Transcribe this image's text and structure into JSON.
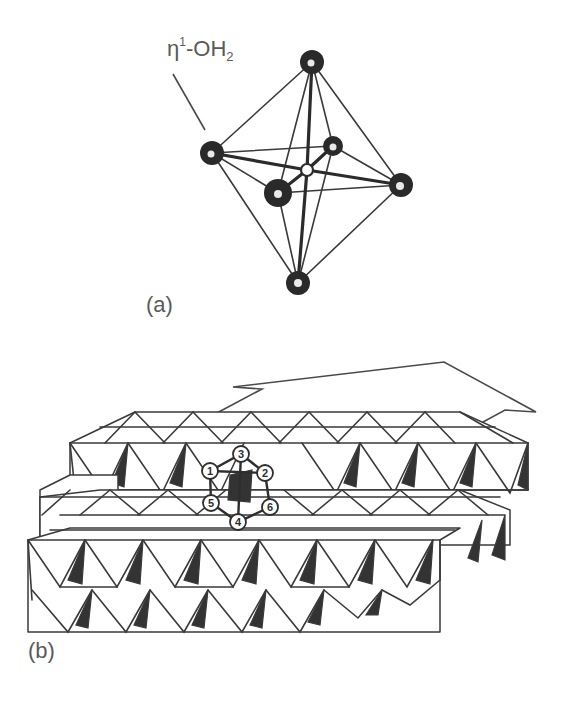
{
  "figure": {
    "panel_a": {
      "label": "(a)",
      "ligand_label": {
        "eta": "η",
        "superscript": "1",
        "mid": "-OH",
        "subscript": "2"
      },
      "description": "Octahedral cluster with central atom and six vertex atoms",
      "atoms": {
        "top": [
          312,
          62
        ],
        "bottom": [
          298,
          283
        ],
        "left": [
          212,
          153
        ],
        "right": [
          401,
          185
        ],
        "front": [
          278,
          193
        ],
        "back": [
          333,
          146
        ],
        "center": [
          307,
          170
        ]
      }
    },
    "panel_b": {
      "label": "(b)",
      "description": "Surface of edge-sharing octahedra with a highlighted adsorption site",
      "sites": [
        {
          "id": "1",
          "x": 210,
          "y": 471
        },
        {
          "id": "2",
          "x": 265,
          "y": 473
        },
        {
          "id": "3",
          "x": 241,
          "y": 454
        },
        {
          "id": "4",
          "x": 238,
          "y": 522
        },
        {
          "id": "5",
          "x": 211,
          "y": 503
        },
        {
          "id": "6",
          "x": 270,
          "y": 507
        }
      ]
    }
  }
}
